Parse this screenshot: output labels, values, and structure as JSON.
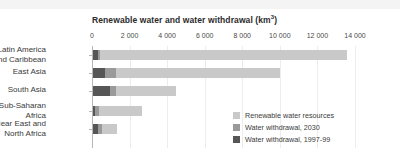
{
  "chart_data": {
    "type": "bar",
    "orientation": "horizontal",
    "stacked": false,
    "overlaid": true,
    "title_main": "Renewable water and water withdrawal (km",
    "title_sup": "3",
    "title_tail": ")",
    "xlabel": "",
    "ylabel": "",
    "unit": "km³",
    "xlim": [
      0,
      14800
    ],
    "xticks": [
      0,
      2000,
      4000,
      6000,
      8000,
      10000,
      12000,
      14000
    ],
    "xtick_labels": [
      "0",
      "2 000",
      "4 000",
      "6 000",
      "8 000",
      "10 000",
      "12 000",
      "14 000"
    ],
    "grid": true,
    "legend_position": "inside-bottom-right",
    "categories": [
      "Latin America\nand Caribbean",
      "East Asia",
      "South Asia",
      "Sub-Saharan\nAfrica",
      "Near East and\nNorth Africa"
    ],
    "series": [
      {
        "name": "Renewable water resources",
        "color": "#c9c9c9",
        "values": [
          13500,
          9950,
          4400,
          2600,
          1300
        ]
      },
      {
        "name": "Water withdrawal, 2030",
        "color": "#9a9a9a",
        "values": [
          380,
          1250,
          1250,
          330,
          500
        ]
      },
      {
        "name": "Water withdrawal, 1997-99",
        "color": "#565656",
        "values": [
          250,
          630,
          900,
          130,
          270
        ]
      }
    ]
  },
  "legend": {
    "items": [
      {
        "label": "Renewable water resources",
        "color": "#c9c9c9"
      },
      {
        "label": "Water withdrawal, 2030",
        "color": "#9a9a9a"
      },
      {
        "label": "Water withdrawal, 1997-99",
        "color": "#565656"
      }
    ]
  }
}
